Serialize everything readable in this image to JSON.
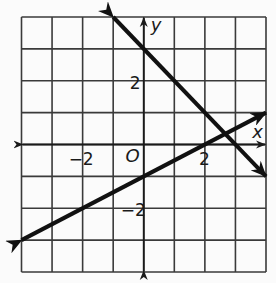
{
  "graph": {
    "x_range": [
      -4,
      4
    ],
    "y_range": [
      -4,
      4
    ],
    "grid_step": 1,
    "axis_labels": {
      "x": "x",
      "y": "y",
      "origin": "O"
    },
    "tick_labels": [
      {
        "axis": "x",
        "value": -2,
        "text": "−2"
      },
      {
        "axis": "x",
        "value": 2,
        "text": "2"
      },
      {
        "axis": "y",
        "value": 2,
        "text": "2"
      },
      {
        "axis": "y",
        "value": -2,
        "text": "−2"
      }
    ],
    "lines": [
      {
        "name": "descending-line",
        "equation": "y = -x + 3",
        "slope": -1,
        "intercept": 3,
        "from": [
          -1,
          4
        ],
        "to": [
          4,
          -1
        ]
      },
      {
        "name": "ascending-line",
        "equation": "y = 0.5x - 1",
        "slope": 0.5,
        "intercept": -1,
        "from": [
          -4,
          -3
        ],
        "to": [
          4,
          1
        ]
      }
    ],
    "intersection": [
      2.67,
      0.33
    ],
    "colors": {
      "grid": "#3a3a3a",
      "lines": "#111111",
      "background": "#fbfbfb"
    }
  }
}
